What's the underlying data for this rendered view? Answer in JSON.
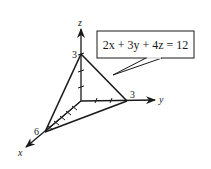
{
  "diagram": {
    "type": "3d-plane-intercepts",
    "equation": "2x + 3y + 4z = 12",
    "axes": {
      "x": {
        "label": "x",
        "intercept_label": "6",
        "ticks": 6
      },
      "y": {
        "label": "y",
        "intercept_label": "3",
        "ticks": 3
      },
      "z": {
        "label": "z",
        "intercept_label": "3",
        "ticks": 3
      }
    },
    "intercepts": [
      {
        "axis": "x",
        "value": 6
      },
      {
        "axis": "y",
        "value": 3
      },
      {
        "axis": "z",
        "value": 3
      }
    ],
    "colors": {
      "stroke": "#1a1a1a",
      "background": "#ffffff"
    }
  }
}
